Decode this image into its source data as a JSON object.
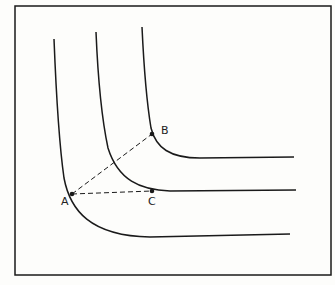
{
  "diagram": {
    "type": "indifference-curves",
    "frame": {
      "x": 15,
      "y": 6,
      "w": 316,
      "h": 269
    },
    "curves": [
      {
        "name": "curve-1",
        "path": "M54 39 C56 90, 60 150, 64 178 C70 210, 90 236, 150 237 L290 234"
      },
      {
        "name": "curve-2",
        "path": "M96 32 C98 80, 102 120, 108 148 C118 180, 140 190, 170 191 L296 190"
      },
      {
        "name": "curve-3",
        "path": "M142 27 C144 70, 148 110, 151 128 C156 148, 170 158, 200 158 L294 157"
      }
    ],
    "points": [
      {
        "label": "A",
        "x": 72,
        "y": 194,
        "label_x": 61,
        "label_y": 195
      },
      {
        "label": "B",
        "x": 152,
        "y": 134,
        "label_x": 161,
        "label_y": 124
      },
      {
        "label": "C",
        "x": 152,
        "y": 191,
        "label_x": 148,
        "label_y": 195
      }
    ],
    "dashed_lines": [
      {
        "from": "A",
        "to": "B"
      },
      {
        "from": "A",
        "to": "C"
      }
    ],
    "colors": {
      "ink": "#1a1a1a",
      "background": "#fdfdfb"
    }
  }
}
